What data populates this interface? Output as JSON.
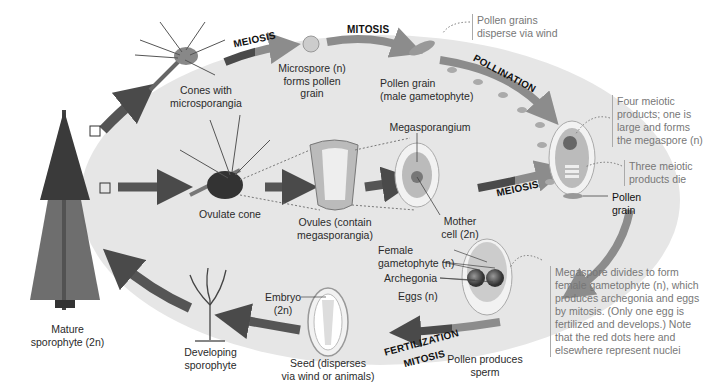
{
  "diagram": {
    "title_type": "Pine life cycle",
    "stages": {
      "meiosis_top": "MEIOSIS",
      "mitosis_top": "MITOSIS",
      "pollination": "POLLINATION",
      "meiosis_mid": "MEIOSIS",
      "fertilization": "FERTILIZATION",
      "mitosis_bottom": "MITOSIS"
    },
    "labels": {
      "cones_micro": [
        "Cones with",
        "microsporangia"
      ],
      "microspore": [
        "Microspore (n)",
        "forms pollen",
        "grain"
      ],
      "pollen_grain": [
        "Pollen grain",
        "(male gametophyte)"
      ],
      "ovulate_cone": "Ovulate cone",
      "ovules": [
        "Ovules (contain",
        "megasporangia)"
      ],
      "megasporangium": "Megasporangium",
      "mother_cell": [
        "Mother",
        "cell (2n)"
      ],
      "pollen_grain_right": [
        "Pollen",
        "grain"
      ],
      "female_gametophyte": [
        "Female",
        "gametophyte (n)"
      ],
      "archegonia": "Archegonia",
      "eggs": "Eggs (n)",
      "pollen_sperm": [
        "Pollen produces",
        "sperm"
      ],
      "embryo": [
        "Embryo",
        "(2n)"
      ],
      "seed": [
        "Seed (disperses",
        "via wind or animals)"
      ],
      "developing": [
        "Developing",
        "sporophyte"
      ],
      "mature": [
        "Mature",
        "sporophyte (2n)"
      ]
    },
    "notes": {
      "pollen_disperse": [
        "Pollen grains",
        "disperse via wind"
      ],
      "four_meiotic": [
        "Four meiotic",
        "products; one is",
        "large and forms",
        "the megaspore (n)"
      ],
      "three_die": [
        "Three meiotic",
        "products die"
      ],
      "megaspore_divides": [
        "Megaspore divides to form",
        "female gametophyte (n), which",
        "produces archegonia and eggs",
        "by mitosis. (Only one egg is",
        "fertilized and develops.) Note",
        "that the red dots here and",
        "elsewhere represent nuclei"
      ]
    },
    "colors": {
      "background_oval": "#e6e6e6",
      "arrow_dark": "#555555",
      "arrow_light": "#8a8a8a",
      "text": "#2a2a2a",
      "note_text": "#777777"
    }
  }
}
